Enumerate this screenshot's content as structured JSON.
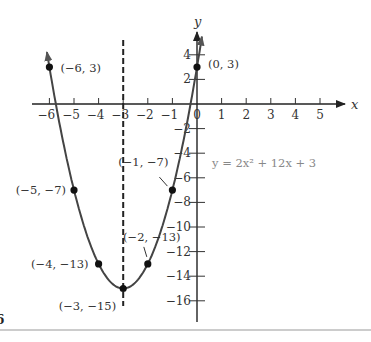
{
  "chart_data": {
    "type": "line",
    "title": "",
    "equation": "y = 2x² + 12x + 3",
    "xlabel": "x",
    "ylabel": "y",
    "xlim": [
      -6.5,
      6
    ],
    "ylim": [
      -17.5,
      5.5
    ],
    "grid": false,
    "x_ticks": [
      -6,
      -5,
      -4,
      -3,
      -2,
      -1,
      0,
      1,
      2,
      3,
      4,
      5
    ],
    "x_tick_labels": [
      "−6",
      "−5",
      "−4",
      "−3",
      "−2",
      "−1",
      "0",
      "1",
      "2",
      "3",
      "4",
      "5"
    ],
    "y_ticks": [
      4,
      2,
      -2,
      -4,
      -6,
      -8,
      -10,
      -12,
      -14,
      -16
    ],
    "y_tick_labels": [
      "4",
      "2",
      "−2",
      "−4",
      "−6",
      "−8",
      "−10",
      "−12",
      "−14",
      "−16"
    ],
    "axis_of_symmetry": {
      "x": -3,
      "style": "dashed"
    },
    "series": [
      {
        "name": "y = 2x² + 12x + 3",
        "x": [
          -6,
          -5,
          -4,
          -3,
          -2,
          -1,
          0
        ],
        "values": [
          3,
          -7,
          -13,
          -15,
          -13,
          -7,
          3
        ]
      }
    ],
    "points": [
      {
        "x": -6,
        "y": 3,
        "label": "(−6, 3)"
      },
      {
        "x": 0,
        "y": 3,
        "label": "(0, 3)"
      },
      {
        "x": -5,
        "y": -7,
        "label": "(−5, −7)"
      },
      {
        "x": -1,
        "y": -7,
        "label": "(−1, −7)"
      },
      {
        "x": -4,
        "y": -13,
        "label": "(−4, −13)"
      },
      {
        "x": -2,
        "y": -13,
        "label": "(−2, −13)"
      },
      {
        "x": -3,
        "y": -15,
        "label": "(−3, −15)"
      }
    ],
    "annotations": [
      "vertex (−3, −15)",
      "axis of symmetry x = −3"
    ]
  },
  "page": {
    "edge_fragment": "6"
  },
  "colors": {
    "curve": "#444444",
    "axis": "#222222",
    "equation_text": "#888888",
    "bottom_rule": "#999999"
  }
}
